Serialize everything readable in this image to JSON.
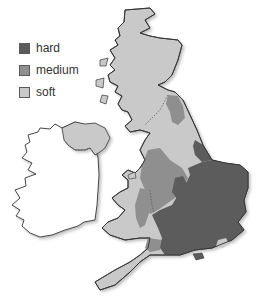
{
  "legend": {
    "items": [
      {
        "label": "hard",
        "color": "#5c5c5c"
      },
      {
        "label": "medium",
        "color": "#8f8f8f"
      },
      {
        "label": "soft",
        "color": "#c9c9c9"
      }
    ]
  },
  "map": {
    "colors": {
      "hard": "#5c5c5c",
      "medium": "#8f8f8f",
      "soft": "#c9c9c9",
      "ireland": "#ffffff",
      "outline": "#333333"
    }
  }
}
